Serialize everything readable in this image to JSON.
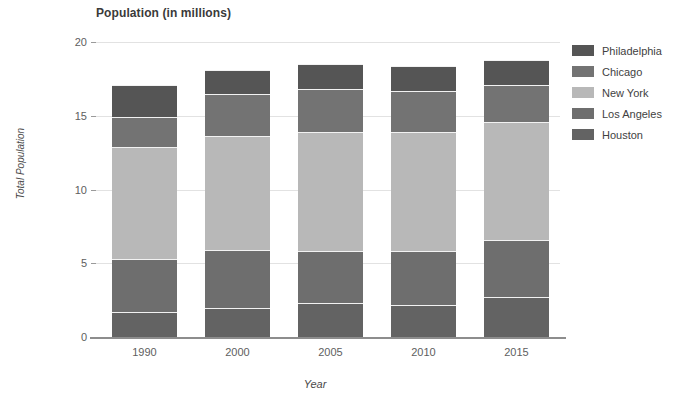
{
  "chart_data": {
    "type": "bar",
    "subtype": "stacked-bar",
    "title": "Population (in millions)",
    "xlabel": "Year",
    "ylabel": "Total Population",
    "categories": [
      "1990",
      "2000",
      "2005",
      "2010",
      "2015"
    ],
    "ylim": [
      0,
      20
    ],
    "yticks": [
      "0",
      "5",
      "10",
      "15",
      "20"
    ],
    "ytick_values": [
      0,
      5,
      10,
      15,
      20
    ],
    "grid": true,
    "legend_position": "right",
    "stack_order_bottom_to_top": [
      "Houston",
      "Los Angeles",
      "New York",
      "Chicago",
      "Philadelphia"
    ],
    "series": [
      {
        "name": "Philadelphia",
        "color": "#555555",
        "values": [
          2.2,
          1.6,
          1.7,
          1.7,
          1.7
        ]
      },
      {
        "name": "Chicago",
        "color": "#737373",
        "values": [
          2.0,
          2.9,
          2.9,
          2.8,
          2.5
        ]
      },
      {
        "name": "New York",
        "color": "#b8b8b8",
        "values": [
          7.6,
          7.7,
          8.1,
          8.1,
          8.0
        ]
      },
      {
        "name": "Los Angeles",
        "color": "#6e6e6e",
        "values": [
          3.6,
          3.9,
          3.5,
          3.6,
          3.9
        ]
      },
      {
        "name": "Houston",
        "color": "#636363",
        "values": [
          1.7,
          2.0,
          2.3,
          2.2,
          2.7
        ]
      }
    ],
    "totals": [
      17.1,
      18.1,
      18.5,
      18.4,
      18.8
    ]
  },
  "legend": {
    "items": [
      {
        "label": "Philadelphia",
        "color": "#555555"
      },
      {
        "label": "Chicago",
        "color": "#737373"
      },
      {
        "label": "New York",
        "color": "#b8b8b8"
      },
      {
        "label": "Los Angeles",
        "color": "#6e6e6e"
      },
      {
        "label": "Houston",
        "color": "#636363"
      }
    ]
  }
}
